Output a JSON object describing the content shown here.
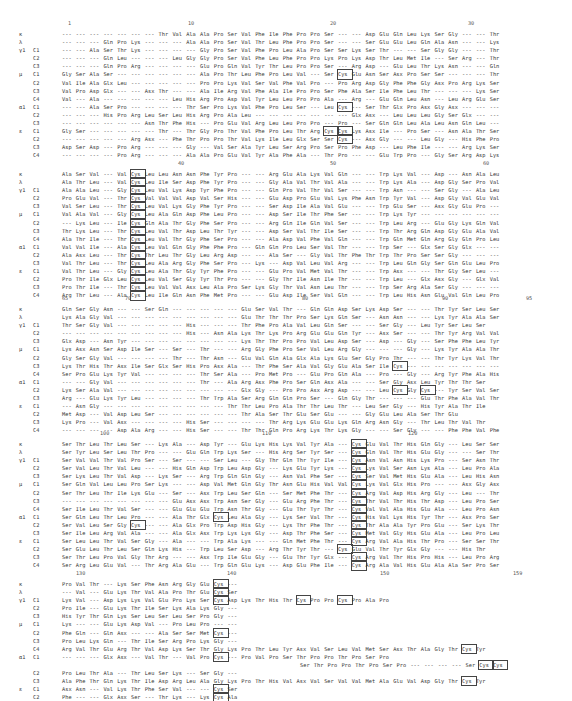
{
  "figure": {
    "row_labels": [
      {
        "group": "κ",
        "chain": ""
      },
      {
        "group": "λ",
        "chain": ""
      },
      {
        "group": "γ1",
        "chain": "C1"
      },
      {
        "group": "",
        "chain": "C2"
      },
      {
        "group": "",
        "chain": "C3"
      },
      {
        "group": "μ",
        "chain": "C1"
      },
      {
        "group": "",
        "chain": "C2"
      },
      {
        "group": "",
        "chain": "C3"
      },
      {
        "group": "",
        "chain": "C4"
      },
      {
        "group": "α1",
        "chain": "C1"
      },
      {
        "group": "",
        "chain": "C2"
      },
      {
        "group": "",
        "chain": "C3"
      },
      {
        "group": "ε",
        "chain": "C1"
      },
      {
        "group": "",
        "chain": "C2"
      },
      {
        "group": "",
        "chain": "C3"
      },
      {
        "group": "",
        "chain": "C4"
      }
    ],
    "blocks": [
      {
        "top": 20,
        "ruler": [
          {
            "label": "1",
            "x": 68
          },
          {
            "label": "10",
            "x": 188
          },
          {
            "label": "20",
            "x": 330
          },
          {
            "label": "30",
            "x": 468
          }
        ],
        "rows": [
          "--- --- --- --- --- --- --- Thr Val Ala Ala Pro Ser Val Phe Ile Phe Pro Pro Ser --- --- Asp Glu Gln Leu Lys Ser Gly --- --- Thr",
          "--- --- --- Gln Pro Lys --- --- --- Ala Ala Pro Ser Val Thr Leu Phe Pro Pro Ser --- --- Ser Glu Glu Leu Gln Ala Asn --- --- Lys",
          "--- --- Ala Ser Thr Lys --- --- --- --- Gly Pro Ser Val Phe Pro Leu Ala Pro Ser Ser Lys Ser Thr --- --- Ser Gly Gly --- --- Thr",
          "--- --- --- Gln Leu --- --- --- Leu Gly Gly Pro Ser Val Phe Leu Phe Pro Pro Lys Pro Lys Asp Thr Leu Met Ile --- Ser Arg --- Thr",
          "--- --- --- Gln Pro Arg --- --- --- --- Glu Pro Gln Val Tyr Thr Leu Pro Pro Ser --- Arg Asp --- Glu Leu Thr Lys Asn --- --- Gln",
          "Gly Ser Ala Ser --- --- --- --- --- --- Ala Pro Thr Leu Phe Pro Leu Val --- Ser [Cys] Glu Asn Ser Asx Pro Ser Ser --- --- --- Thr",
          "Val Ile Ala Glx Leu --- --- --- --- --- Pro Pro Lys Val Ser Val Phe Val Pro --- Pro Arg Asp Gly Phe Phe Gly Asx Pro Arg Lys Ser",
          "Val Pro Asp Glx --- --- Asx Thr --- --- Ala Ile Arg Val Phe Ala Ile Pro Pro Ser Phe Ala Ser Ile Phe Leu Thr --- --- --- Lys Ser",
          "Val --- Ala --- --- --- --- --- Leu His Arg Pro Asp Val Tyr Leu Leu Pro Pro Ala --- Arg --- Glu Gln Leu Asn --- Leu Arg Glu Ser",
          "--- --- Ala Ser Pro --- --- --- --- Thr Ser Pro Lys Val Phe Pro Leu Ser --- Leu [Cys] --- Ser Thr Glx Pro Asx Gly Asx --- --- ---",
          "--- --- --- His Pro Arg Leu Ser Leu His Arg Pro Ala Leu --- --- --- --- --- --- --- Glx Asx --- Leu Leu Leu Gly Ser Glx --- ---",
          "--- --- --- --- --- --- Asn Thr Phe His --- Pro Glu Val Arg Leu Leu Pro Pro --- Pro --- Ser Gln Gln Leu Ala Leu Asn Gln Leu ---",
          "Gly Ser --- --- --- --- --- Thr --- Thr Gly Pro Thr Val Phe Pro Leu Thr Arg [Cys] [Cys] Lys Asx Ile --- Pro Ser --- Asn Ala Thr Ser",
          "--- --- --- --- --- Arg Asx --- Phe Thr Pro Pro Thr Val Lys Ile Leu Glx Ser Ser [Cys] --- Asx Gly --- --- Leu Gly --- His Phe Pro",
          "Asp Ser Asp --- Pro Arg --- --- --- Gly --- Val Ser Ala Tyr Leu Ser Arg Pro Ser Pro Phe Asp --- Leu Phe Ile --- --- Arg Lys Ser",
          "--- --- --- --- Pro Arg --- --- --- Ala Ala Pro Glu Val Tyr Ala Phe Ala --- Thr Pro --- --- Glu Trp Pro --- Gly Ser Arg Asp Lys"
        ]
      },
      {
        "top": 160,
        "ruler": [
          {
            "label": "40",
            "x": 178
          },
          {
            "label": "50",
            "x": 330
          },
          {
            "label": "60",
            "x": 483
          }
        ],
        "rows": [
          "Ala Ser Val --- Val [Cys] Leu Leu Asn Asn Phe Tyr Pro --- --- Arg Glu Ala Lys Val Gln --- --- Trp Lys Val --- Asp --- Asn Ala Leu",
          "Ala Thr Leu --- Val [Cys] Leu Ile Ser Asp Phe Tyr Pro --- --- Gly Ala Val Thr Val Ala --- --- Trp Lys Ala --- Asp Gly Ser Pro Val",
          "Ala Ala Leu --- Gly [Cys] Leu Val Lys Asp Tyr Phe Pro --- --- Gln Pro Val Thr Val Ser --- --- Trp Asn --- --- Ser Gly --- Ala Leu",
          "Pro Glu Val --- Thr [Cys] Val Val Val Asp Val Ser His --- --- Glu Asp Pro Glu Val Lys Phe Asn Trp Tyr Val --- Asp Gly Val Glu Val",
          "Val Ser Leu --- Thr [Cys] Leu Val Lys Gly Phe Tyr Pro --- --- Ser Asp Ile Ala Val Glu --- --- Trp Glu Ser --- Asx Gly Glu Pro ---",
          "Val Ala Val --- Gly [Cys] Leu Ala Gln Asp Phe Leu Pro --- --- Asp Ser Ile Thr Phe Ser --- --- Trp Lys Tyr --- --- --- --- --- ---",
          "--- Lys Leu --- Ile [Cys] Gln Ala Thr Gly Phe Ser Pro --- --- Arg Gln Ile Gln Val Ser --- --- Trp Leu Arg --- Glu Gly Lys Gln Val",
          "Thr Lys Leu --- Thr [Cys] Leu Val Thr Asp Leu Thr Tyr --- --- Asp Ser Val Thr Ile Ser --- --- Trp Thr Arg Gln Asp Gly Glu Ala Val",
          "Ala Thr Ile --- Thr [Cys] Leu Val Thr Gly Phe Ser Pro --- --- Ala Asp Val Phe Val Gln --- --- Trp Gln Met Gln Arg Gly Gln Pro Leu",
          "Val Val Ile --- Ala [Cys] Leu Val Gln Gly Phe Phe Pro --- Gln Gln Pro Leu Ser Val Thr --- --- Trp Ser --- Glx Ser Gly Glx --- ---",
          "Ala Asx Leu --- Thr [Cys] Thr Leu Thr Gly Leu Arg Asp --- --- Ala Ser --- Gly Val Thr Phe Thr Trp Thr Pro Ser Ser Gly --- --- ---",
          "Val Thr Leu --- Thr [Cys] Leu Ala Arg Gly Phe Ser Pro --- Lys --- Asp Val Leu Val Arg --- --- Trp Leu Gln Gly Ser Gln Glu Leu Pro",
          "Val Thr Leu --- Gly [Cys] Leu Ala Thr Gly Tyr Phe Pro --- --- Glu Pro Val Met Val Thr --- --- Trp Asx --- --- Thr Gly Ser Leu ---",
          "Pro Thr Ile Glx Leu [Cys] Leu Val Ser Gly Tyr Thr Pro --- --- Gly Thr Ile Asn Ile Thr --- --- Trp Leu --- Glx Asx Gly --- Glx Val",
          "Pro Thr Ile --- Thr [Cys] Leu Val Val Asx Leu Ala Pro Ser Lys Gly Thr Val Asn Leu Thr --- --- Trp Ser Arg Ala Ser Gly --- --- ---",
          "Arg Thr Leu --- Ala [Cys] Leu Ile Gln Asn Phe Met Pro --- --- Glu Asp Ile Ser Val Gln --- --- Trp Leu His Asn Glu Val Gln Leu Pro"
        ]
      },
      {
        "top": 295,
        "ruler": [
          {
            "label": "65",
            "x": 62
          },
          {
            "label": "70",
            "x": 125
          },
          {
            "label": "80",
            "x": 302
          },
          {
            "label": "90",
            "x": 442
          },
          {
            "label": "95",
            "x": 526
          }
        ],
        "rows": [
          "Gln Ser Gly Asn --- --- Ser Gln --- --- --- --- --- Glu Ser Val Thr --- Gln Gln Asp Ser Lys Asp Ser --- --- Thr Tyr Ser Leu Ser",
          "Lys Ala Gly Val --- --- --- --- --- --- --- --- --- Glu Thr Thr Thr Pro Ser Lys Gln Ser --- Asn Asn --- --- Lys Tyr Ala Ala Ser",
          "Thr Ser Gly Val --- --- --- --- --- His --- --- --- Thr Phe Pro Ala Val Leu Gln Ser --- --- Ser Gly --- Leu Tyr Ser Leu Ser",
          "--- --- --- --- --- --- --- --- --- His --- Asn Ala Lys Thr Lys Pro Arg Glu Glu Gln Tyr --- Asx Ser --- --- Thr Tyr Arg Val Val",
          "Glx Asp --- Asn Tyr --- --- --- --- --- --- --- --- Lys Thr Thr Pro Pro Val Leu Asp Ser --- Asp --- Gly --- Ser Phe Phe Leu Tyr",
          "Lys Asx Asn Ser Asp Ile Ser --- Ser --- Thr --- --- Arg Gly Phe Pro Ser Val Leu Arg Gly --- --- --- Gly --- Lys Tyr Ala Ala Thr",
          "Gly Ser Gly Val --- --- --- --- Thr --- Thr Asn --- Glu Val Gln Ala Glx Ala Lys Glu Ser Gly Pro Thr --- --- Thr Tyr Lys Val Thr",
          "Lys Thr His Thr Asx Ile Ser Glx Ser His Pro Asx Ala --- Thr Phe Ser Ala Val Gly Glu Ala Ser Ile [Cys] --- --- --- --- --- --- ---",
          "Ser Pro Glu Lys Tyr Val --- --- --- --- Thr Ser Ala --- Pro Met Pro --- Glu Pro Gln Ala --- Pro --- Gly --- Arg Tyr Phe Ala His",
          "--- --- Gly Val --- --- --- --- --- --- Thr --- Ala Arg Asx Phe Pro Ser Gln Asx Ala --- --- Ser Gly Asx Leu Tyr Thr Thr Ser",
          "Lys Ser Ala Val --- --- --- --- --- --- --- --- --- Glx Gly --- Pro Pro Asx Arg Asp --- --- Leu [Cys] Gly [Cys] --- Tyr Ser Val Ser",
          "Arg --- Glu Lys Tyr Leu --- --- --- --- Thr Trp Ala Ser Arg Gln Gln Pro Ser --- Gln Gly Thr --- --- --- Glu Thr Phe Ala Val Thr",
          "--- Asn Gly --- --- --- --- --- --- --- --- --- Thr Thr Leu Pro Ala Thr Thr Leu Thr --- Leu Ser Gly --- His Tyr Ala Thr Ile",
          "Met Asp --- Val Asp Leu Ser --- --- --- --- --- --- Thr Ala Ser Thr Glu Ser Glu --- --- Gly Glu Leu Ala Ser Thr Glu",
          "Lys Pro --- Val Asx --- --- --- --- His Ser --- --- --- --- Thr Arg Lys Glu Glu Lys Gln Arg Asn Gly --- Thr Leu Thr Val Thr",
          "--- --- --- --- Asp Ala Arg --- --- His Ser --- --- Thr Thr Gln Pro Arg Lys Thr Lys Gly --- --- Ser Gly --- --- Phe Phe Val Phe"
        ]
      },
      {
        "top": 430,
        "ruler": [
          {
            "label": "100",
            "x": 100
          },
          {
            "label": "110",
            "x": 262
          },
          {
            "label": "120",
            "x": 408
          }
        ],
        "rows": [
          "Ser Thr Leu Thr Leu Ser --- Lys Ala --- Asp Tyr --- Glu Lys His Lys Val Tyr Ala --- [Cys] Glu Val Thr His Gln Gly --- Leu Ser Ser",
          "Ser Tyr Leu Ser Leu Thr Pro --- --- Glu Gln Trp Lys Ser --- His Arg Ser Tyr Ser --- [Cys] Gln Val Thr His Glu Gly --- --- Ser Thr",
          "Ser Val Val Thr Val Pro Ser --- Ser --- --- Ser Leu --- Gly Thr Gln Thr Tyr Ile --- [Cys] Asn Val Asn His Lys Pro --- Ser Asn Thr",
          "Ser Val Leu Thr Val Leu --- --- His Gln Asp Trp Leu Asp Gly --- Lys Glu Tyr Lys --- [Cys] Lys Val Ser Asn Lys Ala --- Leu Pro Ala",
          "Ser Lys Leu Thr Val Asp --- Lys Ser --- Arg Trp Gln Gln Gly --- Asn Val Phe Ser --- [Cys] Ser Val Met His Glu Ala --- Leu His Asn",
          "Ser Gln Val Leu Leu Pro Ser Lys --- --- Asp Val Met Gln Gly Thr Asn Glu His Val Val [Cys] Lys Val Glx His Pro --- --- Asx Gly Asx",
          "Ser Thr Leu Thr Ile Lys Glu --- Ser --- Asx Trp Leu Ser Gln --- Ser Met Phe Thr --- [Cys] Arg Val Asp His Arg Gly --- Leu --- Thr",
          "--- --- --- --- --- --- --- --- Glu Asx Asx Trp Asn Ser Gly --- Glu Arg Phe Thr --- [Cys] Thr Val Thr His Thr Asp --- Leu Pro Ser",
          "Ser Ile Leu Thr Val Ser --- --- Glu Glu Glu Trp Asn Thr Gly --- Glu Thr Tyr Thr --- [Cys] Val Val Ala His Glu Ala --- Leu Pro Asn",
          "Ser Gln Leu Thr Leu Pro --- --- Ala Thr Glx [Cys] Leu Ala Gly --- Lys Ser Val Thr --- [Cys] His Val Lys His Tyr Thr --- Asx Pro Ser",
          "Ser Val Leu Ser Gly [Cys] --- --- Ala Glx Pro Trp Asp His Gly --- Lys Thr Phe Thr --- [Cys] Thr Ala Ala Tyr Pro Glu --- Ser Lys Thr",
          "Ser Ile Leu Arg Val Ala --- --- Ala Glx Asx Trp Lys Lys Gly --- Asp Thr Phe Ser --- [Cys] Met Val Gly His Glu Ala --- Leu Pro Leu",
          "Ser Leu Leu Thr Val Ser Gly --- Ala --- --- Trp Ala Lys --- --- Gln Met Phe Thr --- [Cys] Arg Val Ala His Thr Pro --- Ser Ser Thr",
          "Ser Glu Leu Thr Leu Ser Gln Lys His --- Trp Leu Ser Asp --- Arg Thr Tyr Thr --- [Cys] Glu Val Thr Tyr Glx Gly --- --- His Thr",
          "Ser Thr Leu Pro Val Gly Thr Arg --- --- Asx Trp Ile Glu Gly --- Glu Thr Tyr Glx --- [Cys] Arg Val Thr His Pro His --- Leu Pro Arg",
          "Ser Arg Leu Glu Val --- Thr Arg Ala Glu --- Trp Gln Glu Lys --- Asp Glu Phe Ile --- [Cys] Arg Ala Val His Glu Ala Ala Ser Pro Ser"
        ]
      },
      {
        "top": 570,
        "ruler": [
          {
            "label": "130",
            "x": 76
          },
          {
            "label": "140",
            "x": 227
          },
          {
            "label": "150",
            "x": 380
          },
          {
            "label": "159",
            "x": 513
          }
        ],
        "rows": [
          "Pro Val Thr --- Lys Ser Phe Asn Arg Gly Glu [Cys] ---",
          "--- Val --- Glu Lys Thr Val Ala Pro Thr Glu [Cys] Ser",
          "Lys Val --- Asp Lys Lys Val Glu Pro Lys Ser [Cys] Asp Lys Thr His Thr [Cys] Pro Pro [Cys] Pro Ala Pro",
          "Pro Ile --- Glu Lys Thr Ile Ser Lys Ala Lys Gly ---",
          "His Tyr Thr Gln Lys Ser Leu Ser Leu Ser Pro Gly ---",
          "Lys --- --- Glu Lys Asp Val --- Pro Leu Pro --- ---",
          "Phe Gln --- Gln Asx --- --- Ala Ser Ser Met [Cys] ---",
          "Pro Leu Lys Gln --- Thr Ile Ser Arg Pro Lys Gly ---",
          "Arg Val Thr Glu Arg Thr Val Asp Lys Ser Thr Gly Lys Pro Thr Leu Tyr Asx Val Ser Leu Val Met Ser Asx Thr Ala Gly Thr [Cys] Tyr",
          "--- --- --- Glx Asx --- Val Thr --- Val Pro [Cys] --- Pro Val Pro Ser Thr Pro Pro Thr Pro Ser Pro",
          "Pro Leu Thr Ala --- Thr Leu Ser Lys --- Ser Gly ---",
          "Ala Phe Thr Gln Lys Thr Ile Asp Arg Leu Ala Gly Lys Pro Thr His Val Asx Val Ser Val Val Met Ala Glu Val Asp Gly Thr [Cys] Tyr",
          "Asx Asn --- Val Lys Thr Phe Ser Val --- --- [Cys] Ser",
          "Phe --- --- Glx Asx Ser --- Thr Lys --- Lys [Cys] Ala",
          "Ala Leu --- Met Arg Ser Thr Thr Lys Thr Ser Gly ---",
          "Gln Thr Val Gln Arg Ala Val Ser Val Asn Pro Gly Lys"
        ],
        "alpha_c1_insert": "Ser Thr Pro Pro Thr Pro Ser Pro --- --- --- --- Ser [Cys] [Cys]"
      }
    ]
  }
}
